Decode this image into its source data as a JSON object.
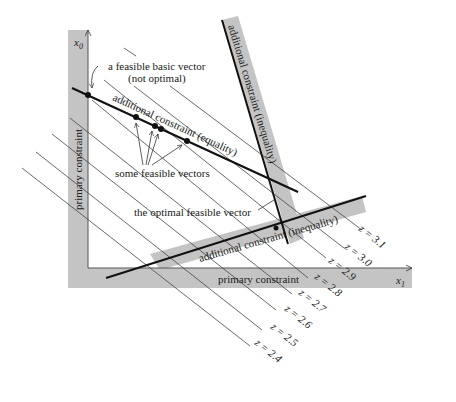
{
  "axes": {
    "x_label": "x",
    "x_sub": "1",
    "y_label": "x",
    "y_sub": "0"
  },
  "bands": {
    "primary_vertical": "primary constraint",
    "primary_horizontal": "primary constraint",
    "inequality_steep": "additional constraint (inequality)",
    "inequality_shallow": "additional constraint (inequality)"
  },
  "labels": {
    "equality": "additional constraint (equality)",
    "basic_vector_line1": "a feasible basic vector",
    "basic_vector_line2": "(not optimal)",
    "feasible_vectors": "some feasible vectors",
    "optimal_vector": "the optimal feasible vector"
  },
  "contours": [
    {
      "label": "z = 2.4"
    },
    {
      "label": "z = 2.5"
    },
    {
      "label": "z = 2.6"
    },
    {
      "label": "z = 2.7"
    },
    {
      "label": "z = 2.8"
    },
    {
      "label": "z = 2.9"
    },
    {
      "label": "z = 3.0"
    },
    {
      "label": "z = 3.1"
    }
  ],
  "colors": {
    "band": "#c4c4c4",
    "line": "#111111",
    "contour": "#444444"
  }
}
